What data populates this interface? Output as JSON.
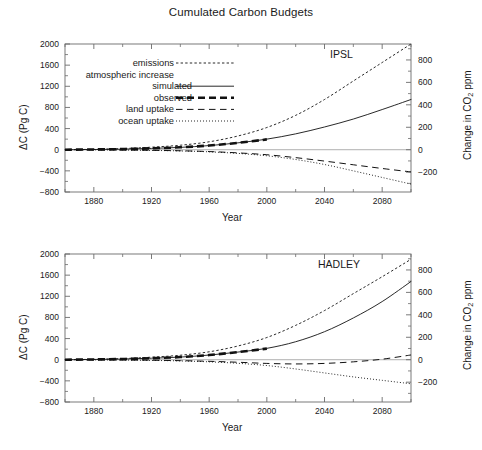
{
  "title": "Cumulated Carbon Budgets",
  "axes": {
    "xlabel": "Year",
    "ylabel_left": "ΔC  (Pg C)",
    "ylabel_right_pre": "Change in CO",
    "ylabel_right_sub": "2",
    "ylabel_right_post": " ppm",
    "xticks": [
      "1880",
      "1920",
      "1960",
      "2000",
      "2040",
      "2080"
    ],
    "yticks_left": [
      "2000",
      "1600",
      "1200",
      "800",
      "400",
      "0",
      "−400",
      "−800"
    ],
    "yticks_right": [
      "800",
      "600",
      "400",
      "200",
      "0",
      "−200"
    ]
  },
  "legend": {
    "items": [
      {
        "label": "emissions",
        "style": "fine-dashed"
      },
      {
        "label": "atmospheric increase",
        "style": "none"
      },
      {
        "label": "simulated",
        "style": "solid"
      },
      {
        "label": "observed",
        "style": "thick-dashed"
      },
      {
        "label": "land uptake",
        "style": "long-dashed"
      },
      {
        "label": "ocean uptake",
        "style": "dotted"
      }
    ]
  },
  "panels": [
    {
      "tag": "IPSL"
    },
    {
      "tag": "HADLEY"
    }
  ],
  "chart_data": {
    "type": "line",
    "title": "Cumulated Carbon Budgets",
    "xlabel": "Year",
    "ylabel": "ΔC (Pg C)",
    "ylabel_secondary": "Change in CO2 ppm",
    "xlim": [
      1860,
      2100
    ],
    "ylim": [
      -800,
      2000
    ],
    "ylim_secondary": [
      -350,
      880
    ],
    "grid": false,
    "legend_position": "upper-left",
    "panels": [
      {
        "name": "IPSL",
        "series": [
          {
            "name": "emissions",
            "style": "fine-dashed",
            "x": [
              1860,
              1880,
              1900,
              1920,
              1940,
              1960,
              1980,
              2000,
              2020,
              2040,
              2060,
              2080,
              2100
            ],
            "y": [
              0,
              8,
              22,
              48,
              85,
              150,
              260,
              420,
              650,
              950,
              1300,
              1650,
              2000
            ]
          },
          {
            "name": "atmospheric increase simulated",
            "style": "solid",
            "x": [
              1860,
              1880,
              1900,
              1920,
              1940,
              1960,
              1980,
              2000,
              2020,
              2040,
              2060,
              2080,
              2100
            ],
            "y": [
              0,
              4,
              11,
              24,
              44,
              78,
              130,
              200,
              300,
              430,
              580,
              760,
              950
            ]
          },
          {
            "name": "atmospheric increase observed",
            "style": "thick-dashed",
            "x": [
              1860,
              1880,
              1900,
              1920,
              1940,
              1960,
              1980,
              2000
            ],
            "y": [
              0,
              5,
              12,
              26,
              46,
              80,
              130,
              195
            ]
          },
          {
            "name": "land uptake",
            "style": "long-dashed",
            "x": [
              1860,
              1880,
              1900,
              1920,
              1940,
              1960,
              1980,
              2000,
              2020,
              2040,
              2060,
              2080,
              2100
            ],
            "y": [
              0,
              -2,
              -6,
              -12,
              -20,
              -35,
              -60,
              -95,
              -150,
              -215,
              -285,
              -355,
              -420
            ]
          },
          {
            "name": "ocean uptake",
            "style": "dotted",
            "x": [
              1860,
              1880,
              1900,
              1920,
              1940,
              1960,
              1980,
              2000,
              2020,
              2040,
              2060,
              2080,
              2100
            ],
            "y": [
              0,
              -2,
              -6,
              -13,
              -23,
              -40,
              -70,
              -115,
              -185,
              -280,
              -400,
              -525,
              -650
            ]
          }
        ]
      },
      {
        "name": "HADLEY",
        "series": [
          {
            "name": "emissions",
            "style": "fine-dashed",
            "x": [
              1860,
              1880,
              1900,
              1920,
              1940,
              1960,
              1980,
              2000,
              2020,
              2040,
              2060,
              2080,
              2100
            ],
            "y": [
              0,
              8,
              22,
              48,
              85,
              150,
              260,
              420,
              650,
              930,
              1250,
              1570,
              1900
            ]
          },
          {
            "name": "atmospheric increase simulated",
            "style": "solid",
            "x": [
              1860,
              1880,
              1900,
              1920,
              1940,
              1960,
              1980,
              2000,
              2020,
              2040,
              2060,
              2080,
              2100
            ],
            "y": [
              0,
              5,
              13,
              28,
              50,
              88,
              145,
              215,
              340,
              530,
              790,
              1100,
              1480
            ]
          },
          {
            "name": "atmospheric increase observed",
            "style": "thick-dashed",
            "x": [
              1860,
              1880,
              1900,
              1920,
              1940,
              1960,
              1980,
              2000
            ],
            "y": [
              0,
              5,
              13,
              28,
              50,
              88,
              145,
              210
            ]
          },
          {
            "name": "land uptake",
            "style": "long-dashed",
            "x": [
              1860,
              1880,
              1900,
              1920,
              1940,
              1960,
              1980,
              2000,
              2020,
              2040,
              2060,
              2080,
              2100
            ],
            "y": [
              0,
              -2,
              -5,
              -10,
              -18,
              -30,
              -48,
              -70,
              -80,
              -70,
              -40,
              10,
              90
            ]
          },
          {
            "name": "ocean uptake",
            "style": "dotted",
            "x": [
              1860,
              1880,
              1900,
              1920,
              1940,
              1960,
              1980,
              2000,
              2020,
              2040,
              2060,
              2080,
              2100
            ],
            "y": [
              0,
              -2,
              -6,
              -13,
              -23,
              -40,
              -68,
              -110,
              -175,
              -250,
              -325,
              -390,
              -455
            ]
          }
        ]
      }
    ]
  }
}
